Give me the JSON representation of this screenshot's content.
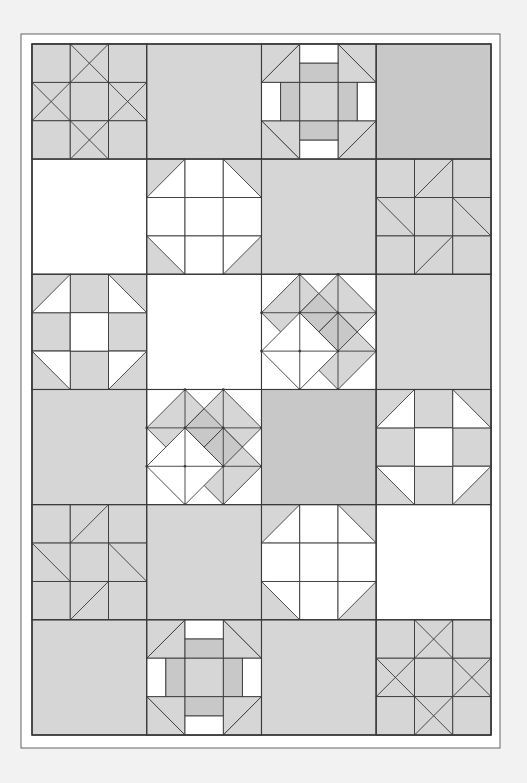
{
  "colors": {
    "page_background": "#f2f2f2",
    "border_fill": "#ffffff",
    "border_line": "#555555",
    "line": "#3a3a3a",
    "light": "#ffffff",
    "medium": "#d6d6d6",
    "dark": "#c8c8c8"
  },
  "geometry": {
    "outer_border": {
      "x": 21,
      "y": 34,
      "w": 479,
      "h": 714
    },
    "grid": {
      "x": 32,
      "y": 44,
      "w": 459,
      "h": 691,
      "cols": 4,
      "rows": 6
    }
  },
  "grid": {
    "rows": [
      [
        {
          "block": "ohio-star",
          "base": "medium"
        },
        {
          "block": "plain",
          "base": "medium"
        },
        {
          "block": "churn-dash",
          "base": "medium"
        },
        {
          "block": "plain",
          "base": "dark"
        }
      ],
      [
        {
          "block": "plain",
          "base": "light"
        },
        {
          "block": "snowball-nine-patch",
          "base": "light",
          "corner": "medium"
        },
        {
          "block": "plain",
          "base": "medium"
        },
        {
          "block": "friendship-star",
          "base": "medium"
        }
      ],
      [
        {
          "block": "shoofly",
          "base": "medium"
        },
        {
          "block": "plain",
          "base": "light"
        },
        {
          "block": "diamond-cross",
          "base": "light"
        },
        {
          "block": "plain",
          "base": "medium"
        }
      ],
      [
        {
          "block": "plain",
          "base": "medium"
        },
        {
          "block": "diamond-cross",
          "base": "light"
        },
        {
          "block": "plain",
          "base": "dark"
        },
        {
          "block": "shoofly",
          "base": "medium"
        }
      ],
      [
        {
          "block": "friendship-star",
          "base": "medium"
        },
        {
          "block": "plain",
          "base": "medium"
        },
        {
          "block": "snowball-nine-patch",
          "base": "light",
          "corner": "medium"
        },
        {
          "block": "plain",
          "base": "light"
        }
      ],
      [
        {
          "block": "plain",
          "base": "medium"
        },
        {
          "block": "churn-dash",
          "base": "medium"
        },
        {
          "block": "plain",
          "base": "medium"
        },
        {
          "block": "ohio-star",
          "base": "medium"
        }
      ]
    ]
  }
}
